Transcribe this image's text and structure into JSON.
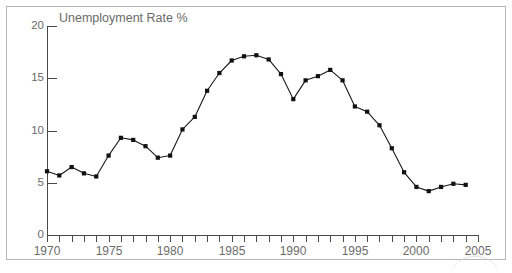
{
  "chart_data": {
    "type": "line",
    "title": "Unemployment Rate %",
    "xlabel": "",
    "ylabel": "",
    "xlim": [
      1970,
      2005
    ],
    "ylim": [
      0,
      20
    ],
    "ytick_labels": [
      "0",
      "5",
      "10",
      "15",
      "20"
    ],
    "yticks": [
      0,
      5,
      10,
      15,
      20
    ],
    "xtick_labels": [
      "1970",
      "1975",
      "1980",
      "1985",
      "1990",
      "1995",
      "2000",
      "2005"
    ],
    "xticks_major": [
      1970,
      1975,
      1980,
      1985,
      1990,
      1995,
      2000,
      2005
    ],
    "xticks_minor_step": 1,
    "grid": false,
    "legend": false,
    "marker": "square",
    "line_color": "#1a1a1a",
    "marker_color": "#111111",
    "axis_color": "#4a4a4a",
    "label_color": "#6b6b6b",
    "background": "#ffffff",
    "x": [
      1970,
      1971,
      1972,
      1973,
      1974,
      1975,
      1976,
      1977,
      1978,
      1979,
      1980,
      1981,
      1982,
      1983,
      1984,
      1985,
      1986,
      1987,
      1988,
      1989,
      1990,
      1991,
      1992,
      1993,
      1994,
      1995,
      1996,
      1997,
      1998,
      1999,
      2000,
      2001,
      2002,
      2003,
      2004
    ],
    "values": [
      6.1,
      5.7,
      6.5,
      5.9,
      5.6,
      7.6,
      9.3,
      9.1,
      8.5,
      7.4,
      7.6,
      10.1,
      11.3,
      13.8,
      15.5,
      16.7,
      17.1,
      17.2,
      16.8,
      15.4,
      13.0,
      14.8,
      15.2,
      15.8,
      14.8,
      12.3,
      11.8,
      10.5,
      8.3,
      6.0,
      4.6,
      4.2,
      4.6,
      4.9,
      4.8
    ],
    "series": [
      {
        "name": "Unemployment Rate %",
        "values": [
          6.1,
          5.7,
          6.5,
          5.9,
          5.6,
          7.6,
          9.3,
          9.1,
          8.5,
          7.4,
          7.6,
          10.1,
          11.3,
          13.8,
          15.5,
          16.7,
          17.1,
          17.2,
          16.8,
          15.4,
          13.0,
          14.8,
          15.2,
          15.8,
          14.8,
          12.3,
          11.8,
          10.5,
          8.3,
          6.0,
          4.6,
          4.2,
          4.6,
          4.9,
          4.8
        ]
      }
    ]
  }
}
